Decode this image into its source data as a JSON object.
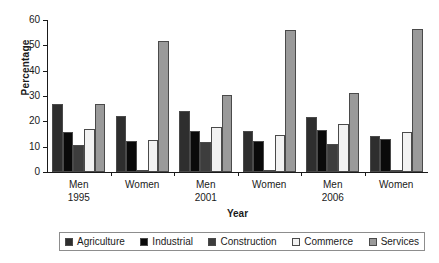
{
  "chart_data": {
    "type": "bar",
    "title": "",
    "xlabel": "Year",
    "ylabel": "Percentage",
    "ylim": [
      0,
      60
    ],
    "yticks": [
      0,
      10,
      20,
      30,
      40,
      50,
      60
    ],
    "ytick_labels": [
      "0",
      "10",
      "20",
      "30",
      "40",
      "50",
      "60"
    ],
    "grid": false,
    "legend_position": "bottom",
    "categories": [
      "Men 1995",
      "Women 1995",
      "Men 2001",
      "Women 2001",
      "Men 2006",
      "Women 2006"
    ],
    "category_labels": [
      {
        "line1": "Men",
        "line2": "1995"
      },
      {
        "line1": "Women",
        "line2": ""
      },
      {
        "line1": "Men",
        "line2": "2001"
      },
      {
        "line1": "Women",
        "line2": ""
      },
      {
        "line1": "Men",
        "line2": "2006"
      },
      {
        "line1": "Women",
        "line2": ""
      }
    ],
    "series": [
      {
        "name": "Agriculture",
        "color": "#2e2e2e",
        "values": [
          26.7,
          22.2,
          24.2,
          16.2,
          21.9,
          14.1
        ]
      },
      {
        "name": "Industrial",
        "color": "#0a0a0a",
        "values": [
          15.8,
          12.2,
          16.1,
          12.2,
          16.4,
          13.0
        ]
      },
      {
        "name": "Construction",
        "color": "#3d3d3d",
        "values": [
          10.7,
          0.5,
          11.8,
          0.5,
          11.2,
          0.5
        ]
      },
      {
        "name": "Commerce",
        "color": "#f2f2f2",
        "values": [
          17.0,
          12.8,
          17.7,
          14.6,
          19.0,
          15.9
        ]
      },
      {
        "name": "Services",
        "color": "#9a9a9a",
        "values": [
          27.0,
          51.6,
          30.3,
          56.0,
          31.3,
          56.6
        ]
      }
    ]
  },
  "legend": {
    "items": [
      {
        "label": "Agriculture",
        "color": "#2e2e2e"
      },
      {
        "label": "Industrial",
        "color": "#0a0a0a"
      },
      {
        "label": "Construction",
        "color": "#3d3d3d"
      },
      {
        "label": "Commerce",
        "color": "#f2f2f2"
      },
      {
        "label": "Services",
        "color": "#9a9a9a"
      }
    ]
  }
}
